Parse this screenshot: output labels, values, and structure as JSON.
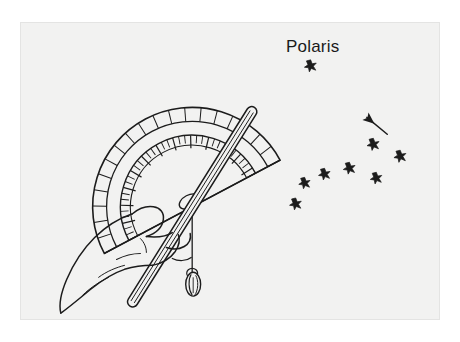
{
  "figure": {
    "caption_visible": false,
    "background_color": "#f2f2f1",
    "ink_color": "#1a1a1a",
    "page_color": "#ffffff",
    "frame": {
      "x": 20,
      "y": 22,
      "width": 420,
      "height": 298
    }
  },
  "labels": {
    "polaris": "Polaris"
  },
  "sky": {
    "polaris_star": {
      "x": 291,
      "y": 43,
      "size": 11
    },
    "pointer_arrow": {
      "name": "pointer-arrow",
      "from": {
        "x": 368,
        "y": 112
      },
      "to": {
        "x": 345,
        "y": 93
      }
    },
    "constellation_name": "Big Dipper",
    "stars": [
      {
        "id": "dubhe",
        "x": 354,
        "y": 122,
        "size": 11
      },
      {
        "id": "merak",
        "x": 381,
        "y": 134,
        "size": 11
      },
      {
        "id": "phecda",
        "x": 357,
        "y": 156,
        "size": 11
      },
      {
        "id": "megrez",
        "x": 330,
        "y": 146,
        "size": 10
      },
      {
        "id": "alioth",
        "x": 305,
        "y": 152,
        "size": 10
      },
      {
        "id": "mizar",
        "x": 285,
        "y": 161,
        "size": 10
      },
      {
        "id": "alkaid",
        "x": 276,
        "y": 182,
        "size": 11
      }
    ]
  },
  "instrument": {
    "name": "homemade astrolabe",
    "parts": [
      {
        "id": "protractor",
        "label": "protractor"
      },
      {
        "id": "sighting-straw",
        "label": "sighting straw"
      },
      {
        "id": "plumb-string",
        "label": "plumb line string"
      },
      {
        "id": "plumb-bob",
        "label": "plumb bob weight"
      },
      {
        "id": "hand",
        "label": "hand"
      }
    ],
    "protractor": {
      "center": {
        "x": 172,
        "y": 185
      },
      "outer_radius": 100,
      "inner_radius": 72,
      "major_tick_count": 19,
      "minor_tick_count": 37
    }
  }
}
